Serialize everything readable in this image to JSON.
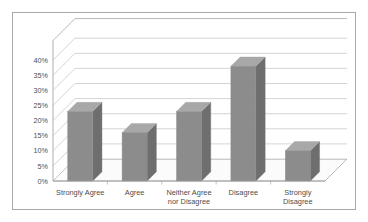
{
  "chart_data": {
    "type": "bar",
    "title": "",
    "subtitle": "",
    "xlabel": "",
    "ylabel": "",
    "categories": [
      "Strongly Agree",
      "Agree",
      "Neither Agree nor Disagree",
      "Disagree",
      "Strongly Disagree"
    ],
    "category_lines": [
      [
        "Strongly Agree"
      ],
      [
        "Agree"
      ],
      [
        "Neither Agree",
        "nor Disagree"
      ],
      [
        "Disagree"
      ],
      [
        "Strongly",
        "Disagree"
      ]
    ],
    "values": [
      23,
      16,
      23,
      38,
      10
    ],
    "ylim": [
      0,
      40
    ],
    "ytick_values": [
      0,
      5,
      10,
      15,
      20,
      25,
      30,
      35,
      40
    ],
    "ytick_labels": [
      "0%",
      "5%",
      "10%",
      "15%",
      "20%",
      "25%",
      "30%",
      "35%",
      "40%"
    ],
    "grid": true,
    "legend": false,
    "legend_position": "none",
    "style": "3d-column",
    "colors": {
      "bar_front": "#8c8c8c",
      "bar_top": "#a8a8a8",
      "bar_side": "#6e6e6e",
      "gridline": "#b7b7b7",
      "axis": "#9a9a9a",
      "floor": "#fbfbfb",
      "border": "#a9a9a9",
      "text": "#4d4d4d",
      "background": "#ffffff"
    }
  }
}
